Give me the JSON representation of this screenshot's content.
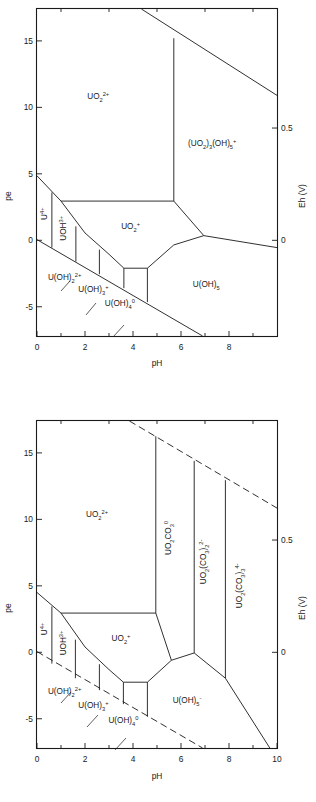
{
  "figure": {
    "kind": "pourbaix-pe-pH-diagrams",
    "panel_count": 2
  },
  "chart_data": [
    {
      "id": "top",
      "type": "line",
      "title": "",
      "subtitle": "",
      "xlabel": "pH",
      "ylabel": "pe",
      "y2label": "Eh (V)",
      "xlim": [
        0,
        10
      ],
      "ylim": [
        -7.2,
        17.4
      ],
      "y2lim": [
        -0.426,
        1.03
      ],
      "grid": false,
      "legend": "none",
      "xticks": [
        0,
        2,
        4,
        6,
        8
      ],
      "xticklabels": [
        "0",
        "2",
        "4",
        "6",
        "8"
      ],
      "xticks_minor": [
        1,
        3,
        5,
        7,
        9
      ],
      "yticks": [
        15,
        10,
        5,
        0,
        -5
      ],
      "yticklabels": [
        "15",
        "10",
        "5",
        "0",
        "-5"
      ],
      "y2ticks": [
        0.5,
        0
      ],
      "y2ticklabels": [
        "0.5",
        "0"
      ],
      "fields": [
        {
          "name": "UO2_2plus",
          "label": "UO",
          "sub": "2",
          "sup": "2+",
          "x": 2.55,
          "y": 10.6,
          "rotate": 0
        },
        {
          "name": "UO2_plus",
          "label": "UO",
          "sub": "2",
          "sup": "+",
          "x": 3.9,
          "y": 0.85,
          "rotate": 0
        },
        {
          "name": "UO2_3_OH_5_plus",
          "label": "(UO",
          "sub": "2",
          "sup": "",
          "tail": ")",
          "x": 7.3,
          "y": 7.1,
          "rotate": 0,
          "full": "(UO2)3(OH)5+"
        },
        {
          "name": "U_4plus",
          "label": "U",
          "sub": "",
          "sup": "4+",
          "x": 0.42,
          "y": 2.0,
          "rotate": -90
        },
        {
          "name": "UOH_3plus",
          "label": "UOH",
          "sub": "",
          "sup": "3+",
          "x": 1.22,
          "y": 0.9,
          "rotate": -90
        },
        {
          "name": "U_OH_2_2plus",
          "label": "U(OH)",
          "sub": "2",
          "sup": "2+",
          "x": 1.15,
          "y": -2.95,
          "rotate": 0
        },
        {
          "name": "U_OH_3_plus",
          "label": "U(OH)",
          "sub": "3",
          "sup": "+",
          "x": 2.35,
          "y": -3.9,
          "rotate": 0
        },
        {
          "name": "U_OH_4_0",
          "label": "U(OH)",
          "sub": "4",
          "sup": "0",
          "x": 3.45,
          "y": -4.95,
          "rotate": 0
        },
        {
          "name": "U_OH_5_minus",
          "label": "U(OH)",
          "sub": "5",
          "sup": "",
          "x": 7.05,
          "y": -3.55,
          "rotate": 0
        }
      ],
      "label_texts": {
        "UO2_2plus": "UO2^2+",
        "UO2_plus": "UO2^+",
        "UO2_3_OH_5_plus": "(UO2)3(OH)5^+",
        "U_4plus": "U^4+",
        "UOH_3plus": "UOH^3+",
        "U_OH_2_2plus": "U(OH)2^2+",
        "U_OH_3_plus": "U(OH)3^+",
        "U_OH_4_0": "U(OH)4^0",
        "U_OH_5_minus": "U(OH)5"
      },
      "boundaries": [
        {
          "name": "water-upper-oxidation-limit",
          "style": "solid",
          "points": [
            [
              4.35,
              17.4
            ],
            [
              10.0,
              10.9
            ]
          ]
        },
        {
          "name": "water-lower-reduction-limit",
          "style": "solid",
          "points": [
            [
              0.0,
              0.05
            ],
            [
              6.9,
              -7.2
            ]
          ]
        },
        {
          "name": "uo2-2plus-to-uo2-3oh5-vertical",
          "style": "solid",
          "points": [
            [
              5.7,
              15.2
            ],
            [
              5.7,
              2.95
            ]
          ]
        },
        {
          "name": "uo2-2plus-to-uo2-plus-horizontal",
          "style": "solid",
          "points": [
            [
              1.0,
              2.95
            ],
            [
              5.7,
              2.95
            ]
          ]
        },
        {
          "name": "u4plus-upper-edge",
          "style": "solid",
          "points": [
            [
              0.0,
              4.85
            ],
            [
              1.0,
              2.95
            ]
          ]
        },
        {
          "name": "u4plus-uoh3plus-vertical",
          "style": "solid",
          "points": [
            [
              0.62,
              3.6
            ],
            [
              0.62,
              -0.55
            ]
          ]
        },
        {
          "name": "uoh3plus-u-oh-2-vertical",
          "style": "solid",
          "points": [
            [
              1.62,
              1.05
            ],
            [
              1.62,
              -1.6
            ]
          ]
        },
        {
          "name": "u-oh-2-u-oh-3-vertical",
          "style": "solid",
          "points": [
            [
              2.6,
              -0.7
            ],
            [
              2.6,
              -2.55
            ]
          ]
        },
        {
          "name": "u-oh-3-u-oh-4-vertical",
          "style": "solid",
          "points": [
            [
              3.62,
              -2.1
            ],
            [
              3.62,
              -3.6
            ]
          ]
        },
        {
          "name": "u-oh-4-u-oh-5-vertical",
          "style": "solid",
          "points": [
            [
              4.6,
              -2.1
            ],
            [
              4.6,
              -4.65
            ]
          ]
        },
        {
          "name": "reduced-species-upper-envelope",
          "style": "solid",
          "points": [
            [
              1.0,
              2.95
            ],
            [
              2.0,
              0.55
            ],
            [
              3.0,
              -1.05
            ],
            [
              3.62,
              -2.1
            ],
            [
              4.6,
              -2.1
            ],
            [
              5.7,
              -0.35
            ],
            [
              6.95,
              0.35
            ],
            [
              10.0,
              -0.55
            ]
          ]
        },
        {
          "name": "uo2-3oh5-to-u-oh-5-edge",
          "style": "solid",
          "points": [
            [
              5.7,
              2.95
            ],
            [
              6.95,
              0.35
            ]
          ]
        }
      ]
    },
    {
      "id": "bottom",
      "type": "line",
      "title": "",
      "subtitle": "",
      "xlabel": "pH",
      "ylabel": "pe",
      "y2label": "Eh (V)",
      "xlim": [
        0,
        10
      ],
      "ylim": [
        -7.2,
        17.4
      ],
      "y2lim": [
        -0.426,
        1.03
      ],
      "grid": false,
      "legend": "none",
      "xticks": [
        0,
        2,
        4,
        6,
        8,
        10
      ],
      "xticklabels": [
        "0",
        "2",
        "4",
        "6",
        "8",
        "10"
      ],
      "xticks_minor": [
        1,
        3,
        5,
        7,
        9
      ],
      "yticks": [
        15,
        10,
        5,
        0,
        -5
      ],
      "yticklabels": [
        "15",
        "10",
        "5",
        "0",
        "-5"
      ],
      "y2ticks": [
        0.5,
        0
      ],
      "y2ticklabels": [
        "0.5",
        "0"
      ],
      "fields": [
        {
          "name": "UO2_2plus",
          "label": "UO2^2+",
          "x": 2.5,
          "y": 10.2,
          "rotate": 0
        },
        {
          "name": "UO2CO3_0",
          "label": "UO2CO3^0",
          "x": 5.6,
          "y": 8.6,
          "rotate": -90
        },
        {
          "name": "UO2_CO3_2_2minus",
          "label": "UO2(CO3)2^2-",
          "x": 7.05,
          "y": 6.8,
          "rotate": -90
        },
        {
          "name": "UO2_CO3_3_4minus",
          "label": "UO2(CO3)3^4-",
          "x": 8.55,
          "y": 5.0,
          "rotate": -90
        },
        {
          "name": "UO2_plus",
          "label": "UO2^+",
          "x": 3.5,
          "y": 0.85,
          "rotate": 0
        },
        {
          "name": "U_4plus",
          "label": "U^4+",
          "x": 0.42,
          "y": 1.75,
          "rotate": -90
        },
        {
          "name": "UOH_3plus",
          "label": "UOH^3+",
          "x": 1.22,
          "y": 0.7,
          "rotate": -90
        },
        {
          "name": "U_OH_2_2plus",
          "label": "U(OH)2^2+",
          "x": 1.15,
          "y": -3.15,
          "rotate": 0
        },
        {
          "name": "U_OH_3_plus",
          "label": "U(OH)3^+",
          "x": 2.35,
          "y": -4.2,
          "rotate": 0
        },
        {
          "name": "U_OH_4_0",
          "label": "U(OH)4^0",
          "x": 3.6,
          "y": -5.35,
          "rotate": 0
        },
        {
          "name": "U_OH_5_minus",
          "label": "U(OH)5^-",
          "x": 6.25,
          "y": -3.85,
          "rotate": 0
        }
      ],
      "boundaries": [
        {
          "name": "water-upper-oxidation-limit",
          "style": "dashed",
          "points": [
            [
              3.85,
              17.4
            ],
            [
              10.0,
              10.85
            ]
          ]
        },
        {
          "name": "water-lower-reduction-limit",
          "style": "dashed",
          "points": [
            [
              0.0,
              0.05
            ],
            [
              6.9,
              -7.2
            ]
          ]
        },
        {
          "name": "uo2-2plus-to-uo2co3-vertical",
          "style": "solid",
          "points": [
            [
              4.95,
              16.25
            ],
            [
              4.95,
              2.95
            ]
          ]
        },
        {
          "name": "uo2co3-to-dicarbonato-vertical",
          "style": "solid",
          "points": [
            [
              6.55,
              14.4
            ],
            [
              6.55,
              -0.05
            ]
          ]
        },
        {
          "name": "dicarbonato-to-tricarbonato-vertical",
          "style": "solid",
          "points": [
            [
              7.85,
              12.95
            ],
            [
              7.85,
              -1.95
            ]
          ]
        },
        {
          "name": "uo2-2plus-to-uo2-plus-horizontal",
          "style": "solid",
          "points": [
            [
              1.0,
              2.95
            ],
            [
              4.95,
              2.95
            ]
          ]
        },
        {
          "name": "u4plus-upper-edge",
          "style": "solid",
          "points": [
            [
              0.0,
              4.5
            ],
            [
              1.0,
              2.95
            ]
          ]
        },
        {
          "name": "u4plus-uoh3plus-vertical",
          "style": "solid",
          "points": [
            [
              0.62,
              3.45
            ],
            [
              0.62,
              -0.85
            ]
          ]
        },
        {
          "name": "uoh3plus-u-oh-2-vertical",
          "style": "solid",
          "points": [
            [
              1.6,
              0.95
            ],
            [
              1.6,
              -1.95
            ]
          ]
        },
        {
          "name": "u-oh-2-u-oh-3-vertical",
          "style": "solid",
          "points": [
            [
              2.6,
              -0.9
            ],
            [
              2.6,
              -2.85
            ]
          ]
        },
        {
          "name": "u-oh-3-u-oh-4-vertical",
          "style": "solid",
          "points": [
            [
              3.6,
              -2.25
            ],
            [
              3.6,
              -3.9
            ]
          ]
        },
        {
          "name": "u-oh-4-u-oh-5-vertical",
          "style": "solid",
          "points": [
            [
              4.6,
              -2.25
            ],
            [
              4.6,
              -4.85
            ]
          ]
        },
        {
          "name": "reduced-species-upper-envelope",
          "style": "solid",
          "points": [
            [
              1.0,
              2.95
            ],
            [
              2.0,
              0.4
            ],
            [
              3.0,
              -1.3
            ],
            [
              3.6,
              -2.25
            ],
            [
              4.6,
              -2.25
            ],
            [
              5.6,
              -0.6
            ],
            [
              6.55,
              -0.05
            ],
            [
              7.85,
              -1.95
            ],
            [
              9.7,
              -7.2
            ]
          ]
        },
        {
          "name": "uo2co3-field-lower-edge",
          "style": "solid",
          "points": [
            [
              4.95,
              2.95
            ],
            [
              5.6,
              -0.6
            ]
          ]
        }
      ]
    }
  ]
}
